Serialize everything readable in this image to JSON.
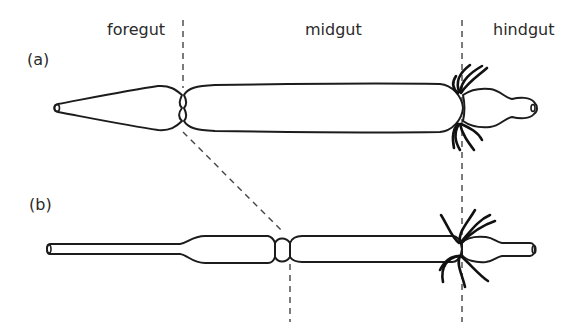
{
  "diagram": {
    "region_labels": {
      "foregut": "foregut",
      "midgut": "midgut",
      "hindgut": "hindgut"
    },
    "panels": [
      {
        "id": "a",
        "label": "(a)"
      },
      {
        "id": "b",
        "label": "(b)"
      }
    ],
    "colors": {
      "stroke": "#1c1c1c",
      "dash": "#444444",
      "background": "#ffffff",
      "text": "#2a2a2a"
    }
  }
}
